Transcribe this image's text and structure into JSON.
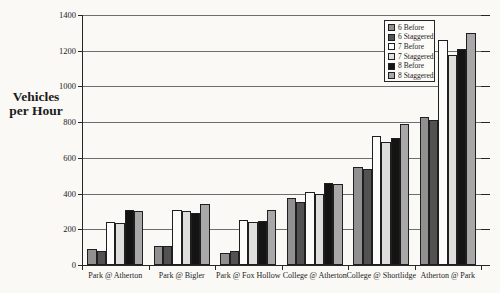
{
  "y_axis_title": {
    "line1": "Vehicles",
    "line2": "per Hour"
  },
  "colors": {
    "paper": "#faf9f5",
    "grid": "#6e6e6e",
    "axis": "#262626",
    "bar_border": "#1f1f1f"
  },
  "chart_data": {
    "type": "bar",
    "title": "",
    "ylabel": "Vehicles per Hour",
    "xlabel": "",
    "ylim": [
      0,
      1400
    ],
    "ytick_interval": 200,
    "ytick_labels": [
      "0",
      "200",
      "400",
      "600",
      "800",
      "1000",
      "1200",
      "1400"
    ],
    "grid": true,
    "legend_position": "top-right-inside",
    "categories": [
      "Park @ Atherton",
      "Park @ Bigler",
      "Park @ Fox Hollow",
      "College @ Atherton",
      "College @ Shortlidge",
      "Atherton @ Park"
    ],
    "series": [
      {
        "name": "6 Before",
        "color": "#909090",
        "values": [
          90,
          105,
          70,
          375,
          550,
          830
        ]
      },
      {
        "name": "6 Staggered",
        "color": "#525252",
        "values": [
          80,
          105,
          80,
          355,
          535,
          810
        ]
      },
      {
        "name": "7 Before",
        "color": "#fcfcfa",
        "values": [
          240,
          310,
          250,
          410,
          725,
          1260
        ]
      },
      {
        "name": "7 Staggered",
        "color": "#dededc",
        "values": [
          235,
          300,
          240,
          400,
          690,
          1175
        ]
      },
      {
        "name": "8 Before",
        "color": "#141414",
        "values": [
          310,
          290,
          245,
          460,
          710,
          1210
        ]
      },
      {
        "name": "8 Staggered",
        "color": "#a8a8a8",
        "values": [
          300,
          340,
          310,
          455,
          790,
          1300
        ]
      }
    ]
  }
}
